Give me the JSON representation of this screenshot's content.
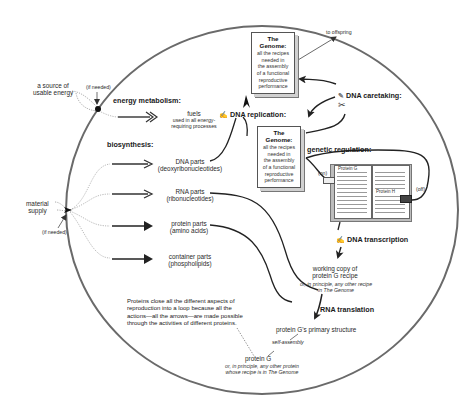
{
  "diagram": {
    "type": "reproduction-cycle",
    "cell_boundary": {
      "shape": "ellipse",
      "color": "#666666"
    },
    "external_inputs": {
      "energy_source": "a source of usable energy",
      "energy_source_line1": "a source of",
      "energy_source_line2": "usable energy",
      "energy_if_needed": "(if needed)",
      "material_supply": "material supply",
      "material_supply_line1": "material",
      "material_supply_line2": "supply",
      "material_if_needed": "(if needed)"
    },
    "energy_metabolism": {
      "heading": "energy metabolism:",
      "product": "fuels",
      "product_note_line1": "used in all energy-",
      "product_note_line2": "requiring processes"
    },
    "biosynthesis": {
      "heading": "biosynthesis:",
      "products": [
        {
          "name": "DNA parts",
          "detail": "(deoxyribonucleotides)"
        },
        {
          "name": "RNA parts",
          "detail": "(ribonucleotides)"
        },
        {
          "name": "protein parts",
          "detail": "(amino acids)"
        },
        {
          "name": "container parts",
          "detail": "(phospholipids)"
        }
      ]
    },
    "genome_top": {
      "title": "The Genome:",
      "lines": [
        "all the recipes",
        "needed in",
        "the assembly",
        "of a functional",
        "reproductive",
        "performance"
      ]
    },
    "genome_bottom": {
      "title": "The Genome:",
      "lines": [
        "all the recipes",
        "needed in",
        "the assembly",
        "of a functional",
        "reproductive",
        "performance"
      ]
    },
    "to_offspring": "to offspring",
    "processes": {
      "dna_replication": "DNA replication:",
      "dna_caretaking": "DNA caretaking:",
      "genetic_regulation": "genetic regulation:",
      "dna_transcription": "DNA transcription",
      "rna_translation": "RNA translation",
      "self_assembly": "self-assembly"
    },
    "regulation": {
      "on_label": "(on)",
      "off_label": "(off)",
      "protein_g_tag": "Protein G",
      "protein_h_tag": "Protein H"
    },
    "working_copy": {
      "line1": "working copy of",
      "line2": "protein G recipe",
      "note_line1": "or, in principle, any other recipe",
      "note_line2": "in The Genome"
    },
    "primary_structure": "protein G's primary structure",
    "protein_g": {
      "name": "protein G",
      "note_line1": "or, in principle, any other protein",
      "note_line2": "whose recipe is in The Genome"
    },
    "loop_note": {
      "line1": "Proteins close all the different aspects of",
      "line2": "reproduction into a loop because all the",
      "line3": "actions—all the arrows—are made possible",
      "line4": "through the activities of different proteins."
    },
    "icons": {
      "replication": "pen-writing-icon",
      "caretaking": "pencil-eraser-icon",
      "scissors": "scissors-icon",
      "transcription": "pen-writing-icon"
    }
  }
}
